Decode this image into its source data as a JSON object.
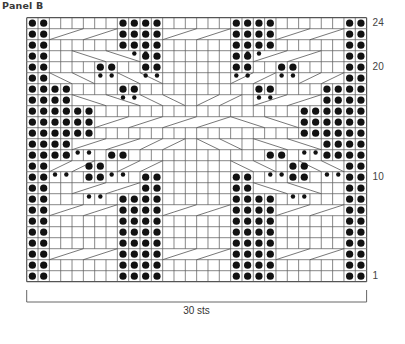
{
  "title": "Panel B",
  "chart_data": {
    "type": "table",
    "title": "Panel B",
    "columns": 30,
    "rows": 24,
    "width_label": "30 sts",
    "row_labels": [
      {
        "row": 24,
        "text": "24"
      },
      {
        "row": 20,
        "text": "20"
      },
      {
        "row": 10,
        "text": "10"
      },
      {
        "row": 1,
        "text": "1"
      }
    ],
    "purl_stitches": {
      "24": [
        1,
        2,
        9,
        10,
        11,
        12,
        19,
        20,
        21,
        22,
        29,
        30
      ],
      "23": [
        1,
        2,
        9,
        10,
        11,
        12,
        19,
        20,
        21,
        22,
        29,
        30
      ],
      "22": [
        1,
        2,
        9,
        10,
        11,
        12,
        19,
        20,
        21,
        22,
        29,
        30
      ],
      "21": [
        1,
        2,
        11,
        12,
        19,
        20,
        29,
        30
      ],
      "20": [
        1,
        2,
        7,
        8,
        11,
        12,
        19,
        20,
        23,
        24,
        29,
        30
      ],
      "19": [
        1,
        2,
        29,
        30
      ],
      "18": [
        1,
        2,
        3,
        4,
        9,
        10,
        21,
        22,
        27,
        28,
        29,
        30
      ],
      "17": [
        1,
        2,
        3,
        4,
        27,
        28,
        29,
        30
      ],
      "16": [
        1,
        2,
        3,
        4,
        5,
        6,
        25,
        26,
        27,
        28,
        29,
        30
      ],
      "15": [
        1,
        2,
        3,
        4,
        5,
        6,
        25,
        26,
        27,
        28,
        29,
        30
      ],
      "14": [
        1,
        2,
        3,
        4,
        5,
        6,
        25,
        26,
        27,
        28,
        29,
        30
      ],
      "13": [
        1,
        2,
        3,
        4,
        27,
        28,
        29,
        30
      ],
      "12": [
        1,
        2,
        3,
        4,
        8,
        9,
        22,
        23,
        27,
        28,
        29,
        30
      ],
      "11": [
        1,
        2,
        6,
        7,
        24,
        25,
        29,
        30
      ],
      "10": [
        1,
        2,
        6,
        7,
        11,
        12,
        19,
        20,
        24,
        25,
        29,
        30
      ],
      "9": [
        1,
        2,
        11,
        12,
        19,
        20,
        29,
        30
      ],
      "8": [
        1,
        2,
        9,
        10,
        11,
        12,
        19,
        20,
        21,
        22,
        29,
        30
      ],
      "7": [
        1,
        2,
        9,
        10,
        11,
        12,
        19,
        20,
        21,
        22,
        29,
        30
      ],
      "6": [
        1,
        2,
        9,
        10,
        11,
        12,
        19,
        20,
        21,
        22,
        29,
        30
      ],
      "5": [
        1,
        2,
        9,
        10,
        11,
        12,
        19,
        20,
        21,
        22,
        29,
        30
      ],
      "4": [
        1,
        2,
        9,
        10,
        11,
        12,
        19,
        20,
        21,
        22,
        29,
        30
      ],
      "3": [
        1,
        2,
        9,
        10,
        11,
        12,
        19,
        20,
        21,
        22,
        29,
        30
      ],
      "2": [
        1,
        2,
        9,
        10,
        11,
        12,
        19,
        20,
        21,
        22,
        29,
        30
      ],
      "1": [
        1,
        2,
        9,
        10,
        11,
        12,
        19,
        20,
        21,
        22,
        29,
        30
      ]
    },
    "purl_markers": {
      "22": [
        10,
        11,
        20,
        21
      ],
      "20": [
        7,
        8,
        11,
        12,
        19,
        20,
        23,
        24
      ],
      "18": [
        9,
        10,
        21,
        22
      ],
      "13": [
        5,
        6,
        25,
        26
      ],
      "11": [
        3,
        4,
        8,
        9,
        22,
        23,
        27,
        28
      ],
      "9": [
        6,
        7,
        24,
        25
      ]
    },
    "cables": [
      {
        "row": 23,
        "start": 3,
        "width": 6,
        "dir": "right"
      },
      {
        "row": 23,
        "start": 13,
        "width": 6,
        "dir": "right"
      },
      {
        "row": 23,
        "start": 23,
        "width": 6,
        "dir": "right"
      },
      {
        "row": 21,
        "start": 5,
        "width": 6,
        "dir": "left"
      },
      {
        "row": 21,
        "start": 21,
        "width": 6,
        "dir": "right"
      },
      {
        "row": 19,
        "start": 3,
        "width": 4,
        "dir": "left"
      },
      {
        "row": 19,
        "start": 9,
        "width": 4,
        "dir": "left"
      },
      {
        "row": 19,
        "start": 19,
        "width": 4,
        "dir": "right"
      },
      {
        "row": 19,
        "start": 25,
        "width": 4,
        "dir": "right"
      },
      {
        "row": 17,
        "start": 5,
        "width": 6,
        "dir": "left"
      },
      {
        "row": 17,
        "start": 11,
        "width": 4,
        "dir": "left"
      },
      {
        "row": 17,
        "start": 16,
        "width": 4,
        "dir": "right"
      },
      {
        "row": 17,
        "start": 21,
        "width": 6,
        "dir": "right"
      },
      {
        "row": 15,
        "start": 7,
        "width": 6,
        "dir": "right"
      },
      {
        "row": 15,
        "start": 13,
        "width": 6,
        "dir": "right"
      },
      {
        "row": 15,
        "start": 19,
        "width": 6,
        "dir": "left"
      },
      {
        "row": 13,
        "start": 5,
        "width": 6,
        "dir": "right"
      },
      {
        "row": 13,
        "start": 11,
        "width": 4,
        "dir": "right"
      },
      {
        "row": 13,
        "start": 16,
        "width": 4,
        "dir": "left"
      },
      {
        "row": 13,
        "start": 21,
        "width": 6,
        "dir": "left"
      },
      {
        "row": 11,
        "start": 3,
        "width": 4,
        "dir": "right"
      },
      {
        "row": 11,
        "start": 9,
        "width": 4,
        "dir": "right"
      },
      {
        "row": 11,
        "start": 19,
        "width": 4,
        "dir": "left"
      },
      {
        "row": 11,
        "start": 25,
        "width": 4,
        "dir": "left"
      },
      {
        "row": 9,
        "start": 5,
        "width": 6,
        "dir": "right"
      },
      {
        "row": 9,
        "start": 21,
        "width": 6,
        "dir": "left"
      },
      {
        "row": 7,
        "start": 3,
        "width": 6,
        "dir": "right"
      },
      {
        "row": 7,
        "start": 13,
        "width": 6,
        "dir": "right"
      },
      {
        "row": 7,
        "start": 23,
        "width": 6,
        "dir": "right"
      },
      {
        "row": 3,
        "start": 3,
        "width": 6,
        "dir": "right"
      },
      {
        "row": 3,
        "start": 13,
        "width": 6,
        "dir": "right"
      },
      {
        "row": 3,
        "start": 23,
        "width": 6,
        "dir": "right"
      }
    ],
    "colors": {
      "grid": "#555555",
      "purl": "#111111",
      "background": "#ffffff"
    }
  }
}
